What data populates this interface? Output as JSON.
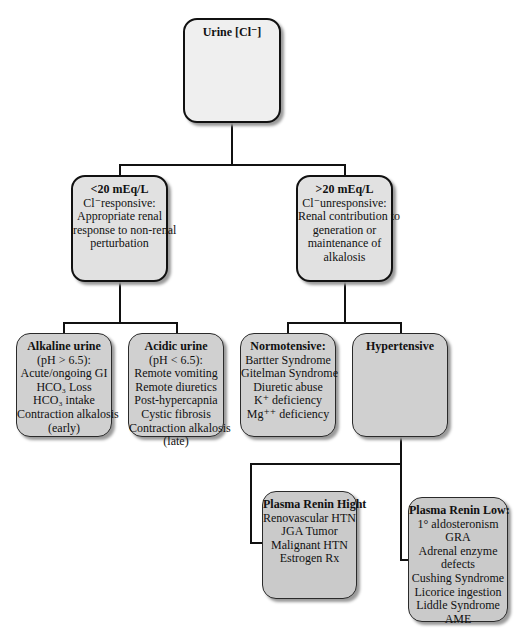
{
  "diagram": {
    "type": "decision-tree",
    "root": {
      "title": "Urine [Cl⁻]"
    },
    "level2": {
      "responsive": {
        "title": "<20 mEq/L",
        "lines": [
          "Cl⁻responsive:",
          "Appropriate renal",
          "response to non-renal",
          "perturbation"
        ]
      },
      "unresponsive": {
        "title": ">20 mEq/L",
        "lines": [
          "Cl⁻unresponsive:",
          "Renal contribution to",
          "generation or",
          "maintenance of",
          "alkalosis"
        ]
      }
    },
    "level3": {
      "alkaline": {
        "title": "Alkaline urine",
        "lines": [
          "(pH > 6.5):",
          "Acute/ongoing GI",
          "HCO₃ Loss",
          "HCO₃ intake",
          "Contraction alkalosis",
          "(early)"
        ]
      },
      "acidic": {
        "title": "Acidic urine",
        "lines": [
          "(pH < 6.5):",
          "Remote vomiting",
          "Remote diuretics",
          "Post-hypercapnia",
          "Cystic fibrosis",
          "Contraction alkalosis",
          "(late)"
        ]
      },
      "normotensive": {
        "title": "Normotensive:",
        "lines": [
          "Bartter Syndrome",
          "Gitelman Syndrome",
          "Diuretic abuse",
          "K⁺ deficiency",
          "Mg⁺⁺ deficiency"
        ]
      },
      "hypertensive": {
        "title": "Hypertensive"
      }
    },
    "level4": {
      "renin_high": {
        "title": "Plasma Renin Hight",
        "lines": [
          "Renovascular HTN",
          "JGA Tumor",
          "Malignant HTN",
          "Estrogen Rx"
        ]
      },
      "renin_low": {
        "title": "Plasma Renin Low:",
        "lines": [
          "1° aldosteronism",
          "GRA",
          "Adrenal enzyme",
          "defects",
          "Cushing Syndrome",
          "Licorice ingestion",
          "Liddle Syndrome",
          "AME"
        ]
      }
    }
  }
}
